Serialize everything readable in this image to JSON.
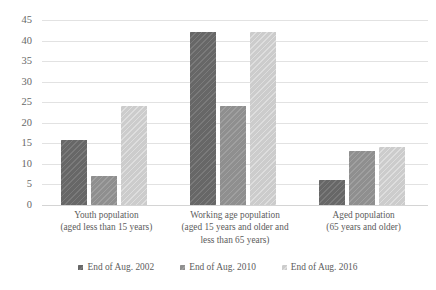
{
  "chart_data": {
    "type": "bar",
    "title": "",
    "xlabel": "",
    "ylabel": "",
    "ylim": [
      0,
      45
    ],
    "yticks": [
      0,
      5,
      10,
      15,
      20,
      25,
      30,
      35,
      40,
      45
    ],
    "grid": true,
    "legend_position": "bottom",
    "categories": [
      "Youth population\n(aged less than 15 years)",
      "Working age population\n(aged 15 years and older and\nless than 65 years)",
      "Aged population\n(65 years and older)"
    ],
    "category_lines": [
      [
        "Youth population",
        "(aged less than 15 years)"
      ],
      [
        "Working age population",
        "(aged 15 years and older and",
        "less than 65 years)"
      ],
      [
        "Aged population",
        "(65 years and older)"
      ]
    ],
    "series": [
      {
        "name": "End of Aug. 2002",
        "color": "#676767",
        "values": [
          15.8,
          42.2,
          6.1
        ]
      },
      {
        "name": "End of Aug. 2010",
        "color": "#8f8f8f",
        "values": [
          7.0,
          24.0,
          13.2
        ]
      },
      {
        "name": "End of Aug. 2016",
        "color": "#cccccc",
        "values": [
          24.0,
          42.2,
          14.1
        ]
      }
    ]
  },
  "axis": {
    "y_tick_labels": [
      "45",
      "40",
      "35",
      "30",
      "25",
      "20",
      "15",
      "10",
      "5",
      "0"
    ]
  },
  "legend": {
    "items": [
      {
        "label": "End of Aug. 2002",
        "color": "#676767"
      },
      {
        "label": "End of Aug. 2010",
        "color": "#8f8f8f"
      },
      {
        "label": "End of Aug. 2016",
        "color": "#cccccc"
      }
    ]
  }
}
